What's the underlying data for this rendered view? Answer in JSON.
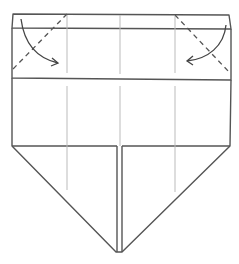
{
  "diagram": {
    "fold_instructions": [
      {
        "side": "left",
        "fold": "valley-fold",
        "direction": "top-left corner down and inward",
        "icon": "curved-arrow-right"
      },
      {
        "side": "right",
        "fold": "valley-fold",
        "direction": "top-right corner down and inward",
        "icon": "curved-arrow-left"
      }
    ],
    "line_styles": {
      "edge": "solid",
      "crease": "thin light",
      "valley_fold": "dashed"
    },
    "colors": {
      "edge": "#555555",
      "crease": "#bbbbbb",
      "background": "#ffffff"
    }
  }
}
